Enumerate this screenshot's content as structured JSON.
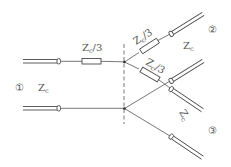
{
  "diagram": {
    "type": "transmission-line three-port resistive power divider (star)",
    "labels": {
      "series_resistor_port1": "Zc/3",
      "series_resistor_port2": "Zc/3",
      "series_resistor_port3": "Zc/3",
      "port1_number": "①",
      "port1_impedance": "Zc",
      "port2_number": "②",
      "port2_impedance": "Zc",
      "port3_number": "③",
      "port3_impedance": "Zc"
    },
    "label_parts": {
      "z": "Z",
      "sub": "c",
      "div3": "/3"
    },
    "ports": [
      {
        "id": "1",
        "symbol": "①",
        "impedance": "Zc",
        "side": "left"
      },
      {
        "id": "2",
        "symbol": "②",
        "impedance": "Zc",
        "side": "upper-right"
      },
      {
        "id": "3",
        "symbol": "③",
        "impedance": "Zc",
        "side": "lower-right"
      }
    ],
    "resistors": [
      {
        "value": "Zc/3",
        "branch": "port 1"
      },
      {
        "value": "Zc/3",
        "branch": "port 2"
      },
      {
        "value": "Zc/3",
        "branch": "port 3"
      }
    ],
    "colors": {
      "line": "#4a4a4a",
      "text": "#555555",
      "background": "#ffffff"
    }
  }
}
